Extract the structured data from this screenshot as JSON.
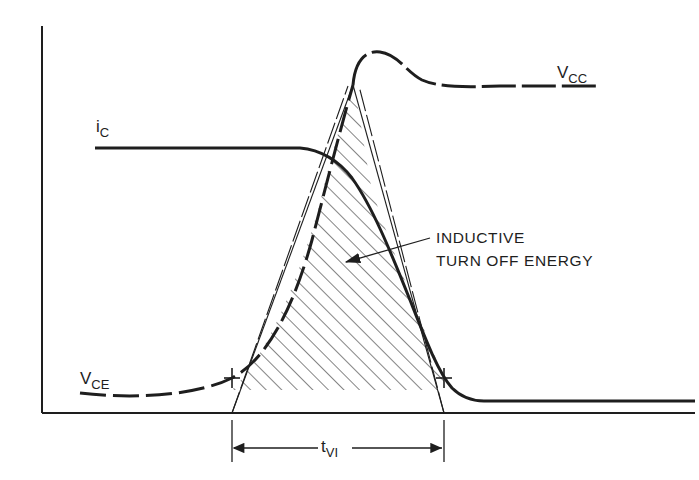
{
  "figure": {
    "type": "switching waveform diagram",
    "background": "#ffffff",
    "ink_color": "#1e1e1e"
  },
  "labels": {
    "vcc": {
      "main": "V",
      "sub": "CC"
    },
    "ic": {
      "main": "i",
      "sub": "C"
    },
    "vce": {
      "main": "V",
      "sub": "CE"
    },
    "tvi": {
      "main": "t",
      "sub": "VI"
    },
    "annotation_line1": "INDUCTIVE",
    "annotation_line2": "TURN OFF ENERGY"
  },
  "curves": [
    {
      "name": "V_CC",
      "style": "dashed",
      "description": "collector supply voltage level with overshoot bump after peak"
    },
    {
      "name": "i_C",
      "style": "solid",
      "description": "collector current flat then falling to zero"
    },
    {
      "name": "V_CE",
      "style": "dashed",
      "description": "collector-emitter voltage rising from low to peak"
    }
  ],
  "regions": [
    {
      "name": "inductive-turn-off-energy",
      "fill": "diagonal hatch",
      "description": "area under V_CE x i_C overlap"
    }
  ],
  "dimension": {
    "name": "t_VI",
    "description": "interval between the two tangent intercept markers"
  }
}
